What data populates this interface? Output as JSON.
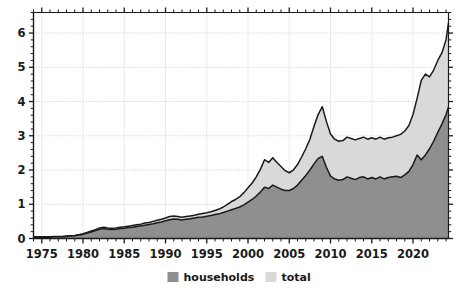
{
  "chart_data": {
    "type": "area",
    "stacked": false,
    "title": "",
    "subtitle": "",
    "xlabel": "",
    "ylabel": "",
    "xlim": [
      1974.0,
      2024.3
    ],
    "ylim": [
      0,
      6.6
    ],
    "grid": true,
    "grid_axis": "y",
    "legend_position": "bottom-center",
    "x_ticks": [
      1975,
      1980,
      1985,
      1990,
      1995,
      2000,
      2005,
      2010,
      2015,
      2020
    ],
    "x_tick_labels": [
      "1975",
      "1980",
      "1985",
      "1990",
      "1995",
      "2000",
      "2005",
      "2010",
      "2015",
      "2020"
    ],
    "x_minor_tick_step": 1,
    "y_ticks": [
      0,
      1,
      2,
      3,
      4,
      5,
      6
    ],
    "y_tick_labels": [
      "0",
      "1",
      "2",
      "3",
      "4",
      "5",
      "6"
    ],
    "y_minor_tick_step": 0.2,
    "colors": {
      "households": "#8f8f8f",
      "total": "#d9d9d9",
      "line": "#1a1a1a",
      "axis": "#1a1a1a",
      "grid": "#c8c8c8",
      "background": "#ffffff"
    },
    "legend": [
      {
        "label": "households",
        "color": "#8f8f8f"
      },
      {
        "label": "total",
        "color": "#d9d9d9"
      }
    ],
    "x": [
      1974.0,
      1974.5,
      1975.0,
      1975.5,
      1976.0,
      1976.5,
      1977.0,
      1977.5,
      1978.0,
      1978.5,
      1979.0,
      1979.5,
      1980.0,
      1980.5,
      1981.0,
      1981.5,
      1982.0,
      1982.5,
      1983.0,
      1983.5,
      1984.0,
      1984.5,
      1985.0,
      1985.5,
      1986.0,
      1986.5,
      1987.0,
      1987.5,
      1988.0,
      1988.5,
      1989.0,
      1989.5,
      1990.0,
      1990.5,
      1991.0,
      1991.5,
      1992.0,
      1992.5,
      1993.0,
      1993.5,
      1994.0,
      1994.5,
      1995.0,
      1995.5,
      1996.0,
      1996.5,
      1997.0,
      1997.5,
      1998.0,
      1998.5,
      1999.0,
      1999.5,
      2000.0,
      2000.5,
      2001.0,
      2001.5,
      2002.0,
      2002.5,
      2003.0,
      2003.5,
      2004.0,
      2004.5,
      2005.0,
      2005.5,
      2006.0,
      2006.5,
      2007.0,
      2007.5,
      2008.0,
      2008.5,
      2009.0,
      2009.5,
      2010.0,
      2010.5,
      2011.0,
      2011.5,
      2012.0,
      2012.5,
      2013.0,
      2013.5,
      2014.0,
      2014.5,
      2015.0,
      2015.5,
      2016.0,
      2016.5,
      2017.0,
      2017.5,
      2018.0,
      2018.5,
      2019.0,
      2019.5,
      2020.0,
      2020.5,
      2021.0,
      2021.5,
      2022.0,
      2022.5,
      2023.0,
      2023.5,
      2024.0,
      2024.3
    ],
    "series": [
      {
        "name": "total",
        "color": "#d9d9d9",
        "values": [
          0.05,
          0.05,
          0.05,
          0.05,
          0.05,
          0.06,
          0.06,
          0.06,
          0.07,
          0.08,
          0.09,
          0.11,
          0.14,
          0.18,
          0.22,
          0.26,
          0.31,
          0.33,
          0.31,
          0.3,
          0.31,
          0.33,
          0.34,
          0.36,
          0.38,
          0.4,
          0.42,
          0.45,
          0.47,
          0.5,
          0.53,
          0.56,
          0.6,
          0.64,
          0.66,
          0.64,
          0.62,
          0.64,
          0.66,
          0.68,
          0.71,
          0.73,
          0.75,
          0.78,
          0.82,
          0.86,
          0.92,
          1.0,
          1.08,
          1.14,
          1.22,
          1.34,
          1.48,
          1.62,
          1.8,
          2.02,
          2.3,
          2.22,
          2.36,
          2.22,
          2.1,
          1.98,
          1.92,
          2.0,
          2.16,
          2.38,
          2.62,
          2.9,
          3.28,
          3.62,
          3.85,
          3.42,
          3.05,
          2.9,
          2.84,
          2.86,
          2.96,
          2.92,
          2.88,
          2.92,
          2.96,
          2.9,
          2.94,
          2.9,
          2.96,
          2.9,
          2.94,
          2.96,
          3.0,
          3.04,
          3.14,
          3.3,
          3.62,
          4.1,
          4.62,
          4.8,
          4.72,
          4.92,
          5.2,
          5.42,
          5.8,
          6.3
        ]
      },
      {
        "name": "households",
        "color": "#8f8f8f",
        "values": [
          0.04,
          0.04,
          0.04,
          0.04,
          0.04,
          0.05,
          0.05,
          0.05,
          0.06,
          0.07,
          0.08,
          0.1,
          0.12,
          0.16,
          0.19,
          0.23,
          0.27,
          0.29,
          0.27,
          0.26,
          0.27,
          0.29,
          0.3,
          0.32,
          0.33,
          0.35,
          0.37,
          0.39,
          0.41,
          0.43,
          0.46,
          0.48,
          0.52,
          0.55,
          0.57,
          0.56,
          0.54,
          0.56,
          0.58,
          0.6,
          0.62,
          0.63,
          0.65,
          0.67,
          0.7,
          0.72,
          0.76,
          0.8,
          0.84,
          0.88,
          0.92,
          0.98,
          1.06,
          1.14,
          1.24,
          1.36,
          1.5,
          1.46,
          1.56,
          1.5,
          1.44,
          1.4,
          1.4,
          1.46,
          1.56,
          1.7,
          1.84,
          2.0,
          2.18,
          2.34,
          2.4,
          2.08,
          1.82,
          1.74,
          1.7,
          1.72,
          1.8,
          1.76,
          1.72,
          1.78,
          1.8,
          1.74,
          1.78,
          1.74,
          1.8,
          1.74,
          1.78,
          1.8,
          1.82,
          1.78,
          1.86,
          1.96,
          2.16,
          2.44,
          2.3,
          2.44,
          2.62,
          2.84,
          3.1,
          3.34,
          3.62,
          3.84
        ]
      }
    ]
  },
  "legend_items": [
    {
      "label": "households"
    },
    {
      "label": "total"
    }
  ]
}
